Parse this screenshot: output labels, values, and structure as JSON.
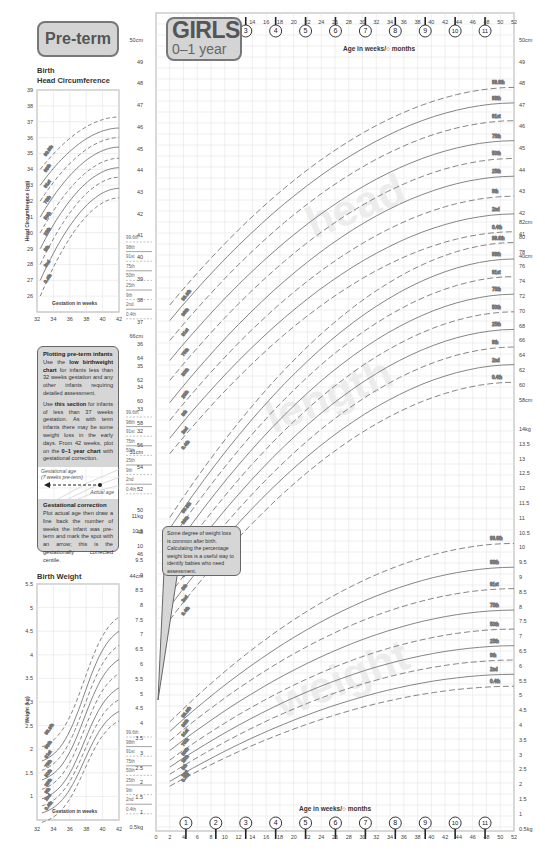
{
  "header": {
    "preterm_label": "Pre-term",
    "title": "GIRLS",
    "subtitle": "0–1 year",
    "age_axis_label": "Age in weeks/○ months"
  },
  "preterm_head": {
    "title_line1": "Birth",
    "title_line2": "Head Circumference",
    "ylabel": "Head Circumference (cm)",
    "xlabel": "Gestation in weeks",
    "yticks": [
      "39",
      "38",
      "37",
      "36",
      "35",
      "34",
      "33",
      "32",
      "31",
      "30",
      "29",
      "28",
      "27",
      "26"
    ],
    "xticks": [
      "32",
      "34",
      "36",
      "38",
      "40",
      "42"
    ]
  },
  "preterm_note": {
    "title": "Plotting pre-term infants",
    "para1_a": "Use the",
    "para1_b": "low birthweight chart",
    "para1_c": "for infants less than 32 weeks gestation and any other infants requiring detailed assessment.",
    "para2_a": "Use",
    "para2_b": "this section",
    "para2_c": "for infants of less than 37 weeks gestation. As with term infants there may be some weight loss in the early days. From 42 weeks, plot on the",
    "para2_d": "0–1 year chart",
    "para2_e": "with gestational correction.",
    "gest_age_label": "Gestational age",
    "weeks_preterm_label": "(7 weeks pre-term)",
    "actual_age_label": "Actual age",
    "correction_title": "Gestational correction",
    "correction_text": "Plot actual age then draw a line back the number of weeks the infant was pre-term and mark the spot with an arrow; this is the gestationally corrected centile."
  },
  "preterm_weight": {
    "title": "Birth Weight",
    "ylabel": "Weight (kg)",
    "xlabel": "Gestation in weeks",
    "yticks": [
      "5.5",
      "5",
      "4.5",
      "4",
      "3.5",
      "3",
      "2.5",
      "2",
      "1.5",
      "1"
    ],
    "xticks": [
      "32",
      "34",
      "36",
      "38",
      "40",
      "42"
    ]
  },
  "weight_callout": "Some degree of weight loss is common after birth. Calculating the percentage weight loss is a useful way to identify babies who need assessment.",
  "centile_labels": [
    "99.6th",
    "98th",
    "91st",
    "75th",
    "50th",
    "25th",
    "9th",
    "2nd",
    "0.4th"
  ],
  "watermarks": {
    "head": "head",
    "length": "length",
    "weight": "weight"
  },
  "main_axes": {
    "top_week_ticks": [
      "14",
      "16",
      "18",
      "20",
      "22",
      "24",
      "26",
      "28",
      "30",
      "32",
      "34",
      "36",
      "38",
      "40",
      "42",
      "44",
      "46",
      "48",
      "50",
      "52"
    ],
    "top_month_markers": [
      "3",
      "4",
      "5",
      "6",
      "7",
      "8",
      "9",
      "10",
      "11"
    ],
    "bottom_week_ticks": [
      "0",
      "2",
      "4",
      "6",
      "8",
      "10",
      "12",
      "14",
      "16",
      "18",
      "20",
      "22",
      "24",
      "26",
      "28",
      "30",
      "32",
      "34",
      "36",
      "38",
      "40",
      "42",
      "44",
      "46",
      "48",
      "50",
      "52"
    ],
    "bottom_month_markers": [
      "1",
      "2",
      "3",
      "4",
      "5",
      "6",
      "7",
      "8",
      "9",
      "10",
      "11"
    ],
    "head_yticks": [
      "50cm",
      "49",
      "48",
      "47",
      "46",
      "45",
      "44",
      "43",
      "42",
      "41",
      "40",
      "39",
      "38",
      "37",
      "36",
      "35",
      "34",
      "33",
      "32",
      "31cm"
    ],
    "head_yticks_right": [
      "50cm",
      "49",
      "48",
      "47",
      "46",
      "45",
      "44",
      "43",
      "42",
      "41",
      "40cm"
    ],
    "length_yticks": [
      "66cm",
      "64",
      "62",
      "60",
      "58",
      "56",
      "54",
      "52",
      "50",
      "48",
      "46",
      "44cm"
    ],
    "length_yticks_right": [
      "82cm",
      "80",
      "78",
      "76",
      "74",
      "72",
      "70",
      "68",
      "66",
      "64",
      "62",
      "60",
      "58cm"
    ],
    "weight_yticks": [
      "11kg",
      "10.5",
      "10",
      "9.5",
      "9",
      "8.5",
      "8",
      "7.5",
      "7",
      "6.5",
      "6",
      "5.5",
      "5",
      "4.5",
      "4",
      "3.5",
      "3",
      "2.5",
      "2",
      "1.5",
      "1",
      "0.5kg"
    ],
    "weight_yticks_right": [
      "14kg",
      "13.5",
      "13",
      "12.5",
      "12",
      "11.5",
      "11",
      "10.5",
      "10",
      "9.5",
      "9",
      "8.5",
      "8",
      "7.5",
      "7",
      "6.5",
      "6",
      "5.5",
      "5",
      "4.5",
      "4",
      "3.5",
      "3",
      "2.5",
      "2",
      "1.5",
      "1",
      "0.5kg"
    ]
  },
  "chart_data": [
    {
      "type": "line",
      "title": "GIRLS 0–1 year – Head circumference",
      "xlabel": "Age in weeks",
      "ylabel": "Head circumference (cm)",
      "x": [
        2,
        52
      ],
      "ylim": [
        31,
        50
      ],
      "series": [
        {
          "name": "99.6th",
          "values": [
            38.2,
            48.0
          ]
        },
        {
          "name": "98th",
          "values": [
            37.5,
            47.3
          ]
        },
        {
          "name": "91st",
          "values": [
            36.6,
            46.5
          ]
        },
        {
          "name": "75th",
          "values": [
            35.7,
            45.6
          ]
        },
        {
          "name": "50th",
          "values": [
            34.8,
            44.8
          ]
        },
        {
          "name": "25th",
          "values": [
            33.8,
            44.0
          ]
        },
        {
          "name": "9th",
          "values": [
            33.0,
            43.1
          ]
        },
        {
          "name": "2nd",
          "values": [
            32.2,
            42.3
          ]
        },
        {
          "name": "0.4th",
          "values": [
            31.5,
            41.5
          ]
        }
      ]
    },
    {
      "type": "line",
      "title": "GIRLS 0–1 year – Length",
      "xlabel": "Age in weeks",
      "ylabel": "Length (cm)",
      "x": [
        2,
        52
      ],
      "ylim": [
        44,
        82
      ],
      "series": [
        {
          "name": "99.6th",
          "values": [
            55.5,
            80.5
          ]
        },
        {
          "name": "98th",
          "values": [
            54.5,
            79.0
          ]
        },
        {
          "name": "91st",
          "values": [
            53.3,
            77.4
          ]
        },
        {
          "name": "75th",
          "values": [
            52.1,
            75.8
          ]
        },
        {
          "name": "50th",
          "values": [
            50.9,
            74.2
          ]
        },
        {
          "name": "25th",
          "values": [
            49.7,
            72.6
          ]
        },
        {
          "name": "9th",
          "values": [
            48.5,
            71.0
          ]
        },
        {
          "name": "2nd",
          "values": [
            47.4,
            69.4
          ]
        },
        {
          "name": "0.4th",
          "values": [
            46.2,
            67.8
          ]
        }
      ]
    },
    {
      "type": "line",
      "title": "GIRLS 0–1 year – Weight",
      "xlabel": "Age in weeks",
      "ylabel": "Weight (kg)",
      "x": [
        2,
        52
      ],
      "ylim": [
        0.5,
        14
      ],
      "series": [
        {
          "name": "99.6th",
          "values": [
            5.0,
            12.5
          ]
        },
        {
          "name": "98th",
          "values": [
            4.6,
            11.5
          ]
        },
        {
          "name": "91st",
          "values": [
            4.2,
            10.6
          ]
        },
        {
          "name": "75th",
          "values": [
            3.8,
            9.7
          ]
        },
        {
          "name": "50th",
          "values": [
            3.4,
            8.9
          ]
        },
        {
          "name": "25th",
          "values": [
            3.1,
            8.2
          ]
        },
        {
          "name": "9th",
          "values": [
            2.8,
            7.6
          ]
        },
        {
          "name": "2nd",
          "values": [
            2.5,
            7.0
          ]
        },
        {
          "name": "0.4th",
          "values": [
            2.3,
            6.5
          ]
        }
      ]
    },
    {
      "type": "line",
      "title": "Pre-term Birth Head Circumference",
      "xlabel": "Gestation in weeks",
      "ylabel": "Head Circumference (cm)",
      "x": [
        32,
        42
      ],
      "ylim": [
        25,
        39
      ],
      "series": [
        {
          "name": "99.6th",
          "values": [
            34.0,
            37.3
          ]
        },
        {
          "name": "98th",
          "values": [
            33.0,
            36.6
          ]
        },
        {
          "name": "91st",
          "values": [
            32.0,
            36.0
          ]
        },
        {
          "name": "75th",
          "values": [
            31.0,
            35.4
          ]
        },
        {
          "name": "50th",
          "values": [
            30.0,
            34.7
          ]
        },
        {
          "name": "25th",
          "values": [
            29.0,
            34.1
          ]
        },
        {
          "name": "9th",
          "values": [
            28.0,
            33.5
          ]
        },
        {
          "name": "2nd",
          "values": [
            27.0,
            32.8
          ]
        },
        {
          "name": "0.4th",
          "values": [
            26.0,
            32.2
          ]
        }
      ]
    },
    {
      "type": "line",
      "title": "Pre-term Birth Weight",
      "xlabel": "Gestation in weeks",
      "ylabel": "Weight (kg)",
      "x": [
        32,
        42
      ],
      "ylim": [
        0.5,
        5.5
      ],
      "series": [
        {
          "name": "99.6th",
          "values": [
            2.6,
            4.8
          ]
        },
        {
          "name": "98th",
          "values": [
            2.3,
            4.5
          ]
        },
        {
          "name": "91st",
          "values": [
            2.1,
            4.2
          ]
        },
        {
          "name": "75th",
          "values": [
            1.9,
            3.9
          ]
        },
        {
          "name": "50th",
          "values": [
            1.7,
            3.6
          ]
        },
        {
          "name": "25th",
          "values": [
            1.5,
            3.3
          ]
        },
        {
          "name": "9th",
          "values": [
            1.35,
            3.05
          ]
        },
        {
          "name": "2nd",
          "values": [
            1.2,
            2.8
          ]
        },
        {
          "name": "0.4th",
          "values": [
            1.0,
            2.6
          ]
        }
      ]
    }
  ]
}
